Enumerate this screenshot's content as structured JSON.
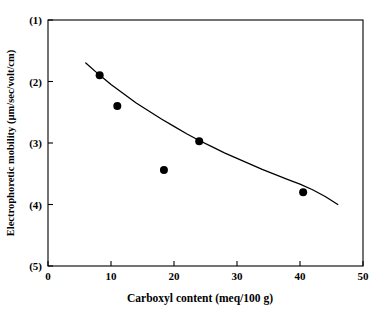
{
  "chart_data": {
    "type": "scatter",
    "title": "",
    "xlabel": "Carboxyl content (meq/100 g)",
    "ylabel": "Electrophoretic mobility (µm/sec/volt/cm)",
    "xlim": [
      0,
      50
    ],
    "ylim": [
      1,
      5
    ],
    "y_axis_inverted": true,
    "grid": false,
    "legend": null,
    "xticks": [
      0,
      10,
      20,
      30,
      40,
      50
    ],
    "xtick_labels": [
      "0",
      "10",
      "20",
      "30",
      "40",
      "50"
    ],
    "yticks": [
      1,
      2,
      3,
      4,
      5
    ],
    "ytick_labels": [
      "(1)",
      "(2)",
      "(3)",
      "(4)",
      "(5)"
    ],
    "marker": "filled-circle",
    "marker_color": "#000000",
    "line_color": "#000000",
    "points": [
      {
        "x": 8.2,
        "y": 1.9
      },
      {
        "x": 11.0,
        "y": 2.4
      },
      {
        "x": 18.4,
        "y": 3.44
      },
      {
        "x": 24.0,
        "y": 2.97
      },
      {
        "x": 40.5,
        "y": 3.8
      }
    ],
    "series": [
      {
        "name": "fitted curve",
        "x": [
          6.0,
          8.0,
          10.0,
          12.0,
          14.0,
          16.0,
          18.0,
          20.0,
          22.0,
          24.0,
          26.0,
          28.0,
          30.0,
          32.0,
          34.0,
          36.0,
          38.0,
          40.0,
          42.0,
          44.0,
          46.0
        ],
        "y": [
          1.7,
          1.88,
          2.05,
          2.2,
          2.35,
          2.48,
          2.61,
          2.73,
          2.85,
          2.96,
          3.06,
          3.16,
          3.25,
          3.34,
          3.43,
          3.51,
          3.59,
          3.67,
          3.76,
          3.87,
          4.0
        ]
      }
    ]
  },
  "axes": {
    "frame_color": "#000000",
    "background": "#ffffff"
  }
}
